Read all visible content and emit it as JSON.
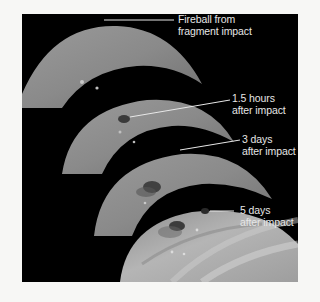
{
  "figure": {
    "background": "#000000",
    "panels": [
      {
        "id": "panel-fireball",
        "label_line1": "Fireball from",
        "label_line2": "fragment impact"
      },
      {
        "id": "panel-1-5-hours",
        "label_line1": "1.5 hours",
        "label_line2": "after impact"
      },
      {
        "id": "panel-3-days",
        "label_line1": "3 days",
        "label_line2": "after impact"
      },
      {
        "id": "panel-5-days",
        "label_line1": "5 days",
        "label_line2": "after impact"
      }
    ]
  }
}
